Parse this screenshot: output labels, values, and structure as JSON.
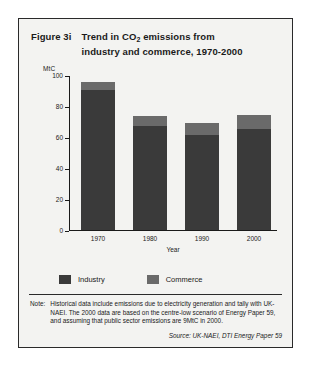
{
  "figure": {
    "label": "Figure 3i",
    "title_line1": "Trend in CO",
    "title_sub": "2",
    "title_line1_rest": " emissions from",
    "title_line2": "industry and commerce, 1970-2000"
  },
  "note": {
    "label": "Note:",
    "text": "Historical data include emissions due to electricity generation and tally with UK-NAEI. The 2000 data are based on the centre-low scenario of Energy Paper 59, and assuming that public sector emissions are 9MtC in 2000."
  },
  "source": "Source: UK-NAEI, DTI Energy Paper 59",
  "colors": {
    "industry": "#3a3a3a",
    "commerce": "#6a6a6a",
    "panel": "#f3f3f1",
    "border": "#2a2a2a"
  },
  "chart_data": {
    "type": "bar",
    "stacked": true,
    "title": "Trend in CO2 emissions from industry and commerce, 1970-2000",
    "xlabel": "Year",
    "ylabel": "MtC",
    "categories": [
      "1970",
      "1980",
      "1990",
      "2000"
    ],
    "series": [
      {
        "name": "Industry",
        "values": [
          90,
          67,
          61,
          65
        ]
      },
      {
        "name": "Commerce",
        "values": [
          5,
          6,
          8,
          9
        ]
      }
    ],
    "totals": [
      95,
      73,
      69,
      74
    ],
    "ylim": [
      0,
      100
    ],
    "yticks": [
      0,
      20,
      40,
      60,
      80,
      100
    ],
    "ytick_labels": [
      "0",
      "20",
      "40",
      "60",
      "80",
      "100"
    ],
    "grid": false,
    "legend": [
      "Industry",
      "Commerce"
    ],
    "legend_position": "bottom"
  }
}
